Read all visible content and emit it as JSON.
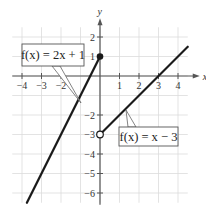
{
  "chart_data": {
    "type": "line",
    "title": "",
    "xlabel": "x",
    "ylabel": "y",
    "xlim": [
      -4.5,
      4.5
    ],
    "ylim": [
      -6.5,
      2.5
    ],
    "grid": true,
    "x_ticks": [
      -4,
      -3,
      -2,
      1,
      2,
      3,
      4
    ],
    "x_tick_labels": [
      "−4",
      "−3",
      "−2",
      "1",
      "2",
      "3",
      "4"
    ],
    "y_ticks": [
      2,
      1,
      -2,
      -3,
      -4,
      -5,
      -6
    ],
    "y_tick_labels": [
      "2",
      "1",
      "−2",
      "−3",
      "−4",
      "−5",
      "−6"
    ],
    "series": [
      {
        "name": "f(x) = 2x + 1",
        "label_text": "f(x) = 2x + 1",
        "x": [
          -3.75,
          0
        ],
        "y": [
          -6.5,
          1
        ],
        "endpoint": {
          "x": 0,
          "y": 1,
          "style": "closed"
        }
      },
      {
        "name": "f(x) = x − 3",
        "label_text": "f(x) = x − 3",
        "x": [
          0,
          4.5
        ],
        "y": [
          -3,
          1.5
        ],
        "endpoint": {
          "x": 0,
          "y": -3,
          "style": "open"
        }
      }
    ],
    "colors": {
      "line": "#1a1a1a",
      "grid": "#dcdcdc",
      "axis": "#555555"
    }
  }
}
